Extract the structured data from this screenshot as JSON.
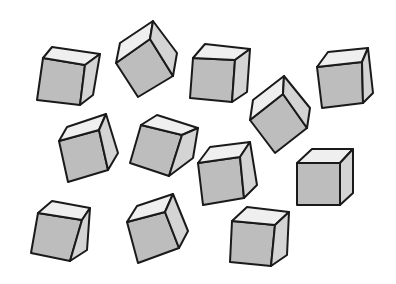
{
  "scene": {
    "description": "Twelve gray isometric cubes scattered at various rotations on a white background",
    "background": "#ffffff",
    "colors": {
      "front_face": "#bdbdbd",
      "top_face": "#efefef",
      "side_face": "#d4d4d4",
      "outline": "#1a1a1a"
    },
    "cube_count": 12,
    "cubes": [
      {
        "id": 1,
        "front": "43,58 85,65 80,105 37,100",
        "top": "43,58 52,47 100,54 85,65",
        "side": "85,65 100,54 93,95 80,105"
      },
      {
        "id": 2,
        "front": "116,63 150,39 173,76 138,97",
        "top": "116,63 120,43 153,21 150,39",
        "side": "150,39 153,21 177,53 173,76"
      },
      {
        "id": 3,
        "front": "193,58 235,60 232,102 190,98",
        "top": "193,58 205,44 250,49 235,60",
        "side": "235,60 250,49 247,92 232,102"
      },
      {
        "id": 4,
        "front": "250,120 283,94 307,128 275,153",
        "top": "250,120 253,100 284,76 283,94",
        "side": "283,94 284,76 310,108 307,128"
      },
      {
        "id": 5,
        "front": "317,67 362,62 363,103 322,108",
        "top": "317,67 328,52 368,48 362,62",
        "side": "362,62 368,48 373,93 363,103"
      },
      {
        "id": 6,
        "front": "59,141 99,130 108,170 68,182",
        "top": "59,141 67,127 106,114 99,130",
        "side": "99,130 106,114 118,153 108,170"
      },
      {
        "id": 7,
        "front": "141,125 182,135 169,176 130,163",
        "top": "141,125 157,115 198,128 182,135",
        "side": "182,135 198,128 193,158 169,176"
      },
      {
        "id": 8,
        "front": "198,163 240,157 244,198 203,205",
        "top": "198,163 210,147 250,142 240,157",
        "side": "240,157 250,142 257,185 244,198"
      },
      {
        "id": 9,
        "front": "297,163 340,163 340,205 297,205",
        "top": "297,163 312,149 353,149 340,163",
        "side": "340,163 353,149 353,193 340,205"
      },
      {
        "id": 10,
        "front": "38,213 82,220 70,261 31,253",
        "top": "38,213 52,201 90,208 82,220",
        "side": "82,220 90,208 87,250 70,261"
      },
      {
        "id": 11,
        "front": "127,222 165,212 179,248 138,263",
        "top": "127,222 137,206 173,194 165,212",
        "side": "165,212 173,194 188,231 179,248"
      },
      {
        "id": 12,
        "front": "232,221 275,225 271,266 230,262",
        "top": "232,221 247,207 289,212 275,225",
        "side": "275,225 289,212 287,255 271,266"
      }
    ]
  }
}
